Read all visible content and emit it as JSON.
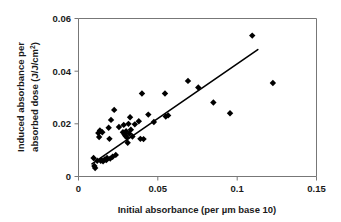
{
  "chart_data": {
    "type": "scatter",
    "title": "",
    "xlabel": "Initial absorbance (per µm base 10)",
    "ylabel": "Induced absorbance per absorbed dose (J/J/cm²)",
    "ylabel_line1": "Induced absorbance per",
    "ylabel_line2": "absorbed dose (J/J/cm",
    "ylabel_line2_sup": "2",
    "ylabel_line2_end": ")",
    "xlim": [
      0,
      0.15
    ],
    "ylim": [
      0,
      0.06
    ],
    "xticks": [
      0,
      0.05,
      0.1,
      0.15
    ],
    "xtick_labels": [
      "0",
      "0.05",
      "0.1",
      "0.15"
    ],
    "yticks": [
      0,
      0.02,
      0.04,
      0.06
    ],
    "ytick_labels": [
      "0",
      "0.02",
      "0.04",
      "0.06"
    ],
    "grid": false,
    "legend": null,
    "marker_shape": "diamond",
    "marker_color": "#000000",
    "series": [
      {
        "name": "measurements",
        "points": [
          [
            0.0095,
            0.007
          ],
          [
            0.01,
            0.004
          ],
          [
            0.0105,
            0.0032
          ],
          [
            0.0118,
            0.006
          ],
          [
            0.0125,
            0.0165
          ],
          [
            0.013,
            0.015
          ],
          [
            0.0135,
            0.0175
          ],
          [
            0.014,
            0.006
          ],
          [
            0.0145,
            0.0062
          ],
          [
            0.015,
            0.0168
          ],
          [
            0.0155,
            0.0058
          ],
          [
            0.0165,
            0.0065
          ],
          [
            0.0175,
            0.0062
          ],
          [
            0.018,
            0.007
          ],
          [
            0.019,
            0.0185
          ],
          [
            0.0195,
            0.0143
          ],
          [
            0.02,
            0.0068
          ],
          [
            0.0205,
            0.0215
          ],
          [
            0.0215,
            0.0075
          ],
          [
            0.0225,
            0.0253
          ],
          [
            0.0235,
            0.0082
          ],
          [
            0.0255,
            0.0188
          ],
          [
            0.028,
            0.0168
          ],
          [
            0.0285,
            0.0196
          ],
          [
            0.029,
            0.016
          ],
          [
            0.0295,
            0.0155
          ],
          [
            0.03,
            0.0172
          ],
          [
            0.0305,
            0.0148
          ],
          [
            0.031,
            0.0128
          ],
          [
            0.0315,
            0.02
          ],
          [
            0.032,
            0.0163
          ],
          [
            0.0325,
            0.0225
          ],
          [
            0.033,
            0.0178
          ],
          [
            0.034,
            0.0152
          ],
          [
            0.0355,
            0.0198
          ],
          [
            0.038,
            0.021
          ],
          [
            0.039,
            0.0143
          ],
          [
            0.04,
            0.0315
          ],
          [
            0.041,
            0.0142
          ],
          [
            0.044,
            0.0235
          ],
          [
            0.0475,
            0.0207
          ],
          [
            0.0545,
            0.0315
          ],
          [
            0.055,
            0.0228
          ],
          [
            0.0565,
            0.0232
          ],
          [
            0.069,
            0.0363
          ],
          [
            0.0755,
            0.0338
          ],
          [
            0.085,
            0.0281
          ],
          [
            0.0955,
            0.024
          ],
          [
            0.1095,
            0.0535
          ],
          [
            0.1225,
            0.0355
          ]
        ]
      }
    ],
    "trend_line": {
      "name": "linear fit",
      "x_start": 0.0085,
      "y_start": 0.0048,
      "x_end": 0.113,
      "y_end": 0.0482,
      "color": "#000000"
    }
  }
}
